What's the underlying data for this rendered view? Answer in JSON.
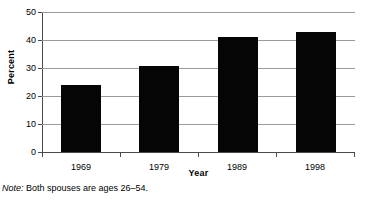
{
  "chart_data": {
    "type": "bar",
    "title": "",
    "xlabel": "Year",
    "ylabel": "Percent",
    "categories": [
      "1969",
      "1979",
      "1989",
      "1998"
    ],
    "values": [
      23.8,
      30.7,
      41.2,
      42.7
    ],
    "ylim": [
      0,
      50
    ],
    "yticks": [
      0,
      10,
      20,
      30,
      40,
      50
    ],
    "ytick_labels": [
      "0",
      "10",
      "20",
      "30",
      "40",
      "50"
    ],
    "grid": true,
    "grid_axis": "y",
    "legend": "none",
    "bar_color": "#050505",
    "gridline_color": "#9a9a9a",
    "axis_color": "#4a4a4a",
    "background": "#ffffff",
    "annotations": []
  },
  "note": {
    "label": "Note:",
    "text": " Both spouses are ages 26–54."
  }
}
